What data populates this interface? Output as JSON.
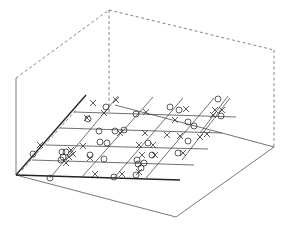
{
  "chart_data": {
    "type": "scatter3d",
    "title": "",
    "xlabel": "",
    "ylabel": "",
    "zlabel": "",
    "grid": true,
    "legend": null,
    "box": {
      "origin": [
        16,
        175
      ],
      "vertical_top": [
        16,
        78
      ],
      "back_top": [
        109,
        10
      ],
      "right_top": [
        274,
        50
      ],
      "right_bottom": [
        274,
        147
      ],
      "front_right": [
        176,
        217
      ]
    },
    "axes_lines": [
      {
        "name": "left-axis",
        "from": [
          16,
          175
        ],
        "to": [
          86,
          95
        ],
        "thick": true
      },
      {
        "name": "front-axis",
        "from": [
          16,
          175
        ],
        "to": [
          180,
          180
        ],
        "thick": true
      }
    ],
    "plane_rows": [
      {
        "from": [
          74,
          112
        ],
        "to": [
          236,
          117
        ]
      },
      {
        "from": [
          60,
          128
        ],
        "to": [
          222,
          133
        ]
      },
      {
        "from": [
          46,
          145
        ],
        "to": [
          208,
          149
        ]
      },
      {
        "from": [
          32,
          160
        ],
        "to": [
          194,
          165
        ]
      }
    ],
    "plane_cols": [
      {
        "from": [
          50,
          178
        ],
        "to": [
          118,
          96
        ]
      },
      {
        "from": [
          82,
          177
        ],
        "to": [
          153,
          97
        ]
      },
      {
        "from": [
          114,
          178
        ],
        "to": [
          183,
          98
        ]
      },
      {
        "from": [
          146,
          178
        ],
        "to": [
          214,
          98
        ]
      }
    ],
    "surface_edge": [
      [
        115,
        105
      ],
      [
        222,
        133
      ],
      [
        274,
        147
      ]
    ],
    "series": [
      {
        "name": "circles",
        "marker": "o",
        "points": [
          [
            33,
            154
          ],
          [
            50,
            178
          ],
          [
            62,
            152
          ],
          [
            63,
            157
          ],
          [
            66,
            152
          ],
          [
            61,
            160
          ],
          [
            88,
            119
          ],
          [
            106,
            107
          ],
          [
            99,
            131
          ],
          [
            100,
            142
          ],
          [
            107,
            143
          ],
          [
            104,
            159
          ],
          [
            115,
            131
          ],
          [
            124,
            130
          ],
          [
            136,
            114
          ],
          [
            148,
            143
          ],
          [
            152,
            155
          ],
          [
            137,
            160
          ],
          [
            138,
            164
          ],
          [
            144,
            163
          ],
          [
            141,
            168
          ],
          [
            136,
            175
          ],
          [
            114,
            177
          ],
          [
            170,
            107
          ],
          [
            179,
            110
          ],
          [
            188,
            122
          ],
          [
            194,
            126
          ],
          [
            218,
            99
          ],
          [
            221,
            116
          ],
          [
            188,
            141
          ],
          [
            178,
            153
          ],
          [
            90,
            155
          ]
        ]
      },
      {
        "name": "crosses",
        "marker": "x",
        "points": [
          [
            93,
            103
          ],
          [
            116,
            100
          ],
          [
            104,
            113
          ],
          [
            87,
            118
          ],
          [
            83,
            146
          ],
          [
            71,
            150
          ],
          [
            73,
            154
          ],
          [
            66,
            163
          ],
          [
            69,
            157
          ],
          [
            90,
            158
          ],
          [
            120,
            133
          ],
          [
            145,
            133
          ],
          [
            139,
            145
          ],
          [
            153,
            145
          ],
          [
            155,
            155
          ],
          [
            142,
            155
          ],
          [
            95,
            174
          ],
          [
            122,
            174
          ],
          [
            139,
            172
          ],
          [
            146,
            112
          ],
          [
            175,
            120
          ],
          [
            167,
            135
          ],
          [
            186,
            109
          ],
          [
            180,
            136
          ],
          [
            200,
            137
          ],
          [
            207,
            134
          ],
          [
            215,
            110
          ],
          [
            222,
            110
          ],
          [
            213,
            115
          ],
          [
            183,
            153
          ],
          [
            40,
            145
          ]
        ]
      }
    ]
  }
}
